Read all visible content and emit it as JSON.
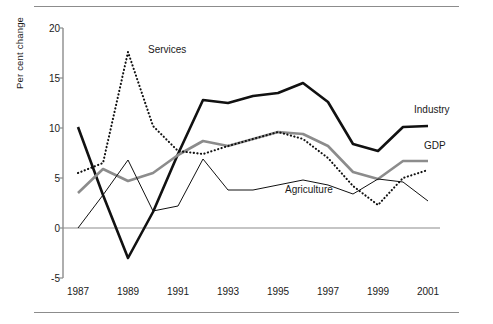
{
  "chart_data": {
    "type": "line",
    "title": "",
    "xlabel": "",
    "ylabel": "Per cent change",
    "xlim": [
      1987,
      2001
    ],
    "ylim": [
      -5,
      20
    ],
    "yticks": [
      20,
      15,
      10,
      5,
      0,
      -5
    ],
    "xticks": [
      1987,
      1989,
      1991,
      1993,
      1995,
      1997,
      1999,
      2001
    ],
    "x": [
      1987,
      1988,
      1989,
      1990,
      1991,
      1992,
      1993,
      1994,
      1995,
      1996,
      1997,
      1998,
      1999,
      2000,
      2001
    ],
    "grid": false,
    "legend": "inline-annotations",
    "zero_line": true,
    "series": [
      {
        "name": "Industry",
        "style": "solid-thick-black",
        "color": "#111111",
        "values": [
          10.1,
          3.3,
          -3.0,
          1.6,
          7.4,
          12.8,
          12.5,
          13.2,
          13.5,
          14.5,
          12.6,
          8.4,
          7.7,
          10.1,
          10.2
        ]
      },
      {
        "name": "GDP",
        "style": "solid-thick-grey",
        "color": "#8c8c8c",
        "values": [
          3.5,
          5.9,
          4.7,
          5.5,
          7.3,
          8.7,
          8.2,
          8.9,
          9.6,
          9.4,
          8.2,
          5.6,
          4.9,
          6.7,
          6.7
        ]
      },
      {
        "name": "Services",
        "style": "dotted-black",
        "color": "#111111",
        "values": [
          5.5,
          6.5,
          17.6,
          10.2,
          7.7,
          7.4,
          8.2,
          8.9,
          9.6,
          8.9,
          7.0,
          4.2,
          2.3,
          5.0,
          5.8
        ]
      },
      {
        "name": "Agriculture",
        "style": "solid-thin-black",
        "color": "#111111",
        "values": [
          0.0,
          3.3,
          6.8,
          1.7,
          2.2,
          6.9,
          3.8,
          3.8,
          4.3,
          4.8,
          4.3,
          3.4,
          4.9,
          4.6,
          2.7
        ]
      }
    ],
    "annotations": [
      {
        "text": "Services",
        "series": "Services"
      },
      {
        "text": "Industry",
        "series": "Industry"
      },
      {
        "text": "GDP",
        "series": "GDP"
      },
      {
        "text": "Agriculture",
        "series": "Agriculture"
      }
    ]
  },
  "axis": {
    "y_title": "Per cent change"
  }
}
